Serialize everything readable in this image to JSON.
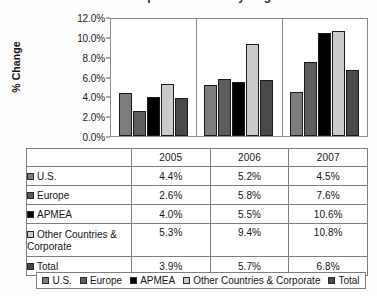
{
  "title": {
    "text": "Comparable Sales by Segment",
    "clipped": true
  },
  "chart_data": {
    "type": "bar",
    "title": "Comparable Sales by Segment",
    "xlabel": "",
    "ylabel": "% Change",
    "categories": [
      "2005",
      "2006",
      "2007"
    ],
    "ylim": [
      0,
      12
    ],
    "ytick_labels": [
      "0.0%",
      "2.0%",
      "4.0%",
      "6.0%",
      "8.0%",
      "10.0%",
      "12.0%"
    ],
    "ytick_values": [
      0,
      2,
      4,
      6,
      8,
      10,
      12
    ],
    "grid": false,
    "legend_position": "bottom",
    "value_suffix": "%",
    "series": [
      {
        "name": "U.S.",
        "color": "#7d7d7d",
        "values": [
          4.4,
          5.2,
          4.5
        ],
        "labels": [
          "4.4%",
          "5.2%",
          "4.5%"
        ]
      },
      {
        "name": "Europe",
        "color": "#5e5e5e",
        "values": [
          2.6,
          5.8,
          7.6
        ],
        "labels": [
          "2.6%",
          "5.8%",
          "7.6%"
        ]
      },
      {
        "name": "APMEA",
        "color": "#000000",
        "values": [
          4.0,
          5.5,
          10.6
        ],
        "labels": [
          "4.0%",
          "5.5%",
          "10.6%"
        ]
      },
      {
        "name": "Other Countries & Corporate",
        "color": "#cbcbcb",
        "values": [
          5.3,
          9.4,
          10.8
        ],
        "labels": [
          "5.3%",
          "9.4%",
          "10.8%"
        ]
      },
      {
        "name": "Total",
        "color": "#4a4a4a",
        "values": [
          3.9,
          5.7,
          6.8
        ],
        "labels": [
          "3.9%",
          "5.7%",
          "6.8%"
        ]
      }
    ]
  },
  "table": {
    "corner_label": "",
    "column_headers": [
      "2005",
      "2006",
      "2007"
    ],
    "rows": [
      {
        "label": "U.S.",
        "swatch": "#7d7d7d",
        "values": [
          "4.4%",
          "5.2%",
          "4.5%"
        ]
      },
      {
        "label": "Europe",
        "swatch": "#5e5e5e",
        "values": [
          "2.6%",
          "5.8%",
          "7.6%"
        ]
      },
      {
        "label": "APMEA",
        "swatch": "#000000",
        "values": [
          "4.0%",
          "5.5%",
          "10.6%"
        ]
      },
      {
        "label": "Other Countries & Corporate",
        "swatch": "#cbcbcb",
        "values": [
          "5.3%",
          "9.4%",
          "10.8%"
        ]
      },
      {
        "label": "Total",
        "swatch": "#4a4a4a",
        "values": [
          "3.9%",
          "5.7%",
          "6.8%"
        ]
      }
    ]
  },
  "legend": {
    "items": [
      {
        "label": "U.S.",
        "color": "#7d7d7d"
      },
      {
        "label": "Europe",
        "color": "#5e5e5e"
      },
      {
        "label": "APMEA",
        "color": "#000000"
      },
      {
        "label": "Other Countries & Corporate",
        "color": "#cbcbcb"
      },
      {
        "label": "Total",
        "color": "#4a4a4a"
      }
    ]
  }
}
